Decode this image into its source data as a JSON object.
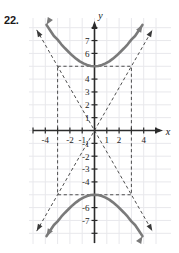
{
  "exercise": {
    "number_label": "22."
  },
  "figure": {
    "background_color": "#ffffff",
    "grid_color": "#e8e8ec",
    "axis_color": "#2b2b2b",
    "curve_color": "#7a7a7a",
    "dash_color": "#3a3a3a",
    "axis_labels": {
      "x": "x",
      "y": "y"
    },
    "x_tick_labels": [
      {
        "value": -4,
        "text": "-4"
      },
      {
        "value": -2,
        "text": "-2"
      },
      {
        "value": -1,
        "text": "-1"
      },
      {
        "value": 1,
        "text": "1"
      },
      {
        "value": 2,
        "text": "2"
      },
      {
        "value": 4,
        "text": "4"
      }
    ],
    "y_tick_labels": [
      {
        "value": 7,
        "text": "7"
      },
      {
        "value": 6,
        "text": "6"
      },
      {
        "value": 4,
        "text": "4"
      },
      {
        "value": 3,
        "text": "3"
      },
      {
        "value": 2,
        "text": "2"
      },
      {
        "value": 1,
        "text": "1"
      },
      {
        "value": -1,
        "text": "-1"
      },
      {
        "value": -2,
        "text": "-2"
      },
      {
        "value": -3,
        "text": "-3"
      },
      {
        "value": -4,
        "text": "-4"
      },
      {
        "value": -6,
        "text": "-6"
      },
      {
        "value": -7,
        "text": "-7"
      }
    ]
  },
  "chart_data": {
    "type": "line",
    "title": "",
    "xlabel": "x",
    "ylabel": "y",
    "xlim": [
      -5.4,
      5.4
    ],
    "ylim": [
      -8.2,
      8.2
    ],
    "grid": true,
    "legend": "none",
    "center": [
      0,
      0
    ],
    "vertices": [
      [
        0,
        5
      ],
      [
        0,
        -5
      ]
    ],
    "a": 5,
    "b": 3,
    "asymptote_slopes": [
      1.6667,
      -1.6667
    ],
    "central_box": {
      "x_min": -3,
      "x_max": 3,
      "y_min": -5,
      "y_max": 5
    },
    "series": [
      {
        "name": "upper-branch",
        "points": [
          [
            -3.9,
            8.22
          ],
          [
            -3.6,
            7.78
          ],
          [
            -3.3,
            7.35
          ],
          [
            -3.0,
            7.07
          ],
          [
            -2.7,
            6.71
          ],
          [
            -2.4,
            6.4
          ],
          [
            -2.1,
            6.11
          ],
          [
            -1.8,
            5.83
          ],
          [
            -1.5,
            5.59
          ],
          [
            -1.2,
            5.38
          ],
          [
            -0.9,
            5.22
          ],
          [
            -0.6,
            5.1
          ],
          [
            -0.3,
            5.02
          ],
          [
            0,
            5.0
          ],
          [
            0.3,
            5.02
          ],
          [
            0.6,
            5.1
          ],
          [
            0.9,
            5.22
          ],
          [
            1.2,
            5.38
          ],
          [
            1.5,
            5.59
          ],
          [
            1.8,
            5.83
          ],
          [
            2.1,
            6.11
          ],
          [
            2.4,
            6.4
          ],
          [
            2.7,
            6.71
          ],
          [
            3.0,
            7.07
          ],
          [
            3.3,
            7.35
          ],
          [
            3.6,
            7.78
          ],
          [
            3.9,
            8.22
          ]
        ]
      },
      {
        "name": "lower-branch",
        "points": [
          [
            -3.9,
            -8.22
          ],
          [
            -3.6,
            -7.78
          ],
          [
            -3.3,
            -7.35
          ],
          [
            -3.0,
            -7.07
          ],
          [
            -2.7,
            -6.71
          ],
          [
            -2.4,
            -6.4
          ],
          [
            -2.1,
            -6.11
          ],
          [
            -1.8,
            -5.83
          ],
          [
            -1.5,
            -5.59
          ],
          [
            -1.2,
            -5.38
          ],
          [
            -0.9,
            -5.22
          ],
          [
            -0.6,
            -5.1
          ],
          [
            -0.3,
            -5.02
          ],
          [
            0,
            -5.0
          ],
          [
            0.3,
            -5.02
          ],
          [
            0.6,
            -5.1
          ],
          [
            0.9,
            -5.22
          ],
          [
            1.2,
            -5.38
          ],
          [
            1.5,
            -5.59
          ],
          [
            1.8,
            -5.83
          ],
          [
            2.1,
            -6.11
          ],
          [
            2.4,
            -6.4
          ],
          [
            2.7,
            -6.71
          ],
          [
            3.0,
            -7.07
          ],
          [
            3.3,
            -7.35
          ],
          [
            3.6,
            -7.78
          ],
          [
            3.9,
            -8.22
          ]
        ]
      },
      {
        "name": "asymptote-positive",
        "points": [
          [
            -4.7,
            -7.83
          ],
          [
            4.7,
            7.83
          ]
        ]
      },
      {
        "name": "asymptote-negative",
        "points": [
          [
            -4.7,
            7.83
          ],
          [
            4.7,
            -7.83
          ]
        ]
      }
    ]
  }
}
